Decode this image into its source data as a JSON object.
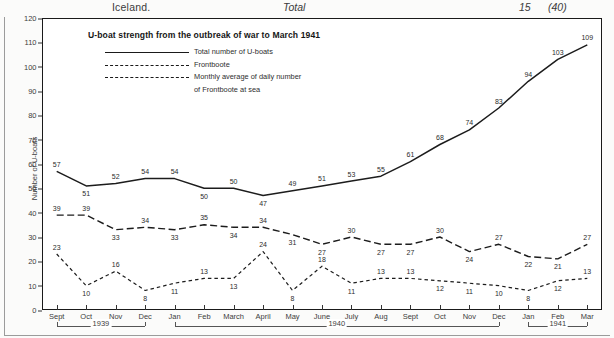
{
  "running_head": {
    "left": "Iceland.",
    "center": "Total",
    "page": "15",
    "note": "(40)"
  },
  "figure": {
    "title": "U-boat strength from the outbreak of war to March 1941",
    "legend": [
      {
        "style": "solid",
        "label": "Total number of U-boats",
        "label2": ""
      },
      {
        "style": "dash-long",
        "label": "Frontboote",
        "label2": ""
      },
      {
        "style": "dash-short",
        "label": "Monthly average of daily number",
        "label2": "of Frontboote at sea"
      }
    ]
  },
  "chart_data": {
    "type": "line",
    "title": "U-boat strength from the outbreak of war to March 1941",
    "xlabel": "",
    "ylabel": "Number of U-boats",
    "ylim": [
      0,
      120
    ],
    "ytick_step": 10,
    "yticks": [
      0,
      10,
      20,
      30,
      40,
      50,
      60,
      70,
      80,
      90,
      100,
      110,
      120
    ],
    "grid": false,
    "legend_position": "top-left",
    "categories": [
      "Sept",
      "Oct",
      "Nov",
      "Dec",
      "Jan",
      "Feb",
      "March",
      "April",
      "May",
      "June",
      "July",
      "Aug",
      "Sept",
      "Oct",
      "Nov",
      "Dec",
      "Jan",
      "Feb",
      "Mar"
    ],
    "year_markers": [
      {
        "label": "1939",
        "start_index": 0,
        "end_index": 3
      },
      {
        "label": "1940",
        "start_index": 4,
        "end_index": 15
      },
      {
        "label": "1941",
        "start_index": 16,
        "end_index": 18
      }
    ],
    "series": [
      {
        "name": "Total number of U-boats",
        "style": "solid",
        "values": [
          57,
          51,
          52,
          54,
          54,
          50,
          50,
          47,
          49,
          51,
          53,
          55,
          61,
          68,
          74,
          83,
          94,
          103,
          109
        ]
      },
      {
        "name": "Frontboote",
        "style": "dash-long",
        "values": [
          39,
          39,
          33,
          34,
          33,
          35,
          34,
          34,
          31,
          27,
          30,
          27,
          27,
          30,
          24,
          27,
          22,
          21,
          27
        ]
      },
      {
        "name": "Monthly average of daily number of Frontboote at sea",
        "style": "dash-short",
        "values": [
          23,
          10,
          16,
          8,
          11,
          13,
          13,
          24,
          8,
          18,
          11,
          13,
          13,
          12,
          11,
          10,
          8,
          12,
          13
        ]
      }
    ]
  }
}
